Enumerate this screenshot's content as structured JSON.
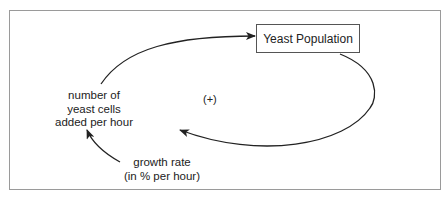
{
  "diagram": {
    "type": "stock-and-flow / causal loop",
    "stock": {
      "label": "Yeast Population"
    },
    "flow": {
      "lines": [
        "number of",
        "yeast cells",
        "added per hour"
      ]
    },
    "parameter": {
      "lines": [
        "growth rate",
        "(in % per hour)"
      ]
    },
    "loop_polarity": "(+)",
    "links": [
      {
        "from": "number of yeast cells added per hour",
        "to": "Yeast Population"
      },
      {
        "from": "Yeast Population",
        "to": "number of yeast cells added per hour"
      },
      {
        "from": "growth rate (in % per hour)",
        "to": "number of yeast cells added per hour"
      }
    ],
    "colors": {
      "line": "#222222",
      "frame": "#9a9a9a",
      "background": "#ffffff"
    }
  }
}
